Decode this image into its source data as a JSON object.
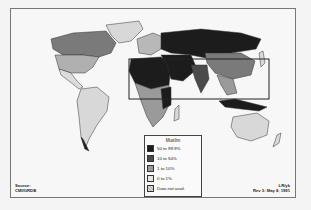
{
  "map": {
    "subject": "Muslim population share by country",
    "highlight_box": "North Africa / Middle East / South & Southeast Asia",
    "colors": {
      "c50_100": "#1c1c1c",
      "c10_50": "#4a4a4a",
      "c1_10": "#9a9a9a",
      "c0_1": "#d8d8d8",
      "na": "#c8c8c8",
      "ocean": "#f7f7f7",
      "border": "#333333"
    }
  },
  "legend": {
    "title": "Muslim",
    "items": [
      {
        "label": "50 to 99.9%",
        "color": "#1c1c1c"
      },
      {
        "label": "10 to 50%",
        "color": "#4a4a4a"
      },
      {
        "label": "1 to 10%",
        "color": "#9a9a9a"
      },
      {
        "label": "0 to 1%",
        "color": "#e6e6e6"
      },
      {
        "label": "Data not avail.",
        "color": "#cfcfcf"
      }
    ]
  },
  "source": {
    "line1": "Source:",
    "line2": "CMI/GRDB"
  },
  "credit": {
    "line1": "LR/yk",
    "line2": "Rev 3: May 8, 1991"
  }
}
